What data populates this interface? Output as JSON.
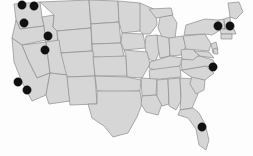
{
  "figure": {
    "width": 253,
    "height": 156
  },
  "style": {
    "background_color": "#fdfdfd",
    "land_fill": "#d6d6d6",
    "border_color": "#8c8c8c",
    "marker_color": "#111111",
    "marker_radius": 4.2
  },
  "chart_data": {
    "type": "scatter",
    "xlabel": "",
    "ylabel": "",
    "xlim": [
      0,
      253
    ],
    "ylim": [
      0,
      156
    ],
    "grid": false,
    "legend": "none",
    "marker_count": 11,
    "series": [
      {
        "name": "locations",
        "marker": "filled-circle",
        "color": "#111111",
        "points": [
          {
            "label": "northern-washington-west",
            "x": 22,
            "y": 5
          },
          {
            "label": "northern-washington-east",
            "x": 34,
            "y": 6
          },
          {
            "label": "western-oregon",
            "x": 24,
            "y": 23
          },
          {
            "label": "northern-utah",
            "x": 48,
            "y": 36
          },
          {
            "label": "central-utah",
            "x": 45,
            "y": 50
          },
          {
            "label": "central-california",
            "x": 18,
            "y": 82
          },
          {
            "label": "southern-california",
            "x": 27,
            "y": 90
          },
          {
            "label": "upstate-new-york",
            "x": 218,
            "y": 26
          },
          {
            "label": "massachusetts",
            "x": 230,
            "y": 26
          },
          {
            "label": "virginia-dc",
            "x": 213,
            "y": 67
          },
          {
            "label": "southern-florida",
            "x": 202,
            "y": 127
          }
        ]
      }
    ]
  }
}
